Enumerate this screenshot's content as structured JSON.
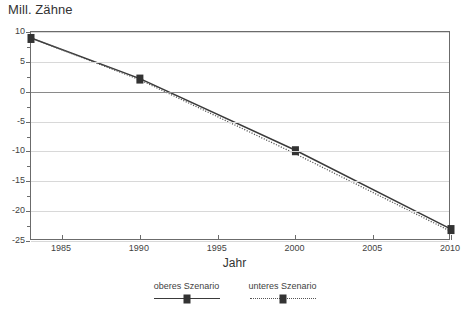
{
  "chart_data": {
    "type": "line",
    "title": "",
    "ylabel": "Mill. Zähne",
    "xlabel": "Jahr",
    "xlim": [
      1983,
      2010
    ],
    "ylim": [
      -25,
      10
    ],
    "grid": true,
    "legend_position": "bottom",
    "y_ticks": [
      10,
      5,
      0,
      -5,
      -10,
      -15,
      -20,
      -25
    ],
    "y_tick_labels": [
      "10",
      "5",
      "0",
      "-5",
      "-10",
      "-15",
      "-20",
      "-25"
    ],
    "y_minor_ticks": [
      7.5,
      2.5,
      -2.5,
      -7.5,
      -12.5,
      -17.5,
      -22.5
    ],
    "x_ticks": [
      1985,
      1990,
      1995,
      2000,
      2005,
      2010
    ],
    "x_tick_labels": [
      "1985",
      "1990",
      "1995",
      "2000",
      "2005",
      "2010"
    ],
    "x": [
      1983,
      1990,
      2000,
      2010
    ],
    "series": [
      {
        "name": "oberes Szenario",
        "style": "solid",
        "marker": "square",
        "color": "#3a3a3a",
        "values": [
          9.0,
          2.2,
          -9.8,
          -23.0
        ]
      },
      {
        "name": "unteres Szenario",
        "style": "dotted",
        "marker": "square",
        "color": "#555555",
        "values": [
          9.0,
          2.0,
          -10.4,
          -23.4
        ]
      }
    ]
  },
  "legend": {
    "items": [
      {
        "label": "oberes Szenario",
        "style": "solid"
      },
      {
        "label": "unteres Szenario",
        "style": "dotted"
      }
    ]
  },
  "colors": {
    "axis": "#6b6b6b",
    "grid": "#d8d8d8",
    "zero_line": "#8a8a8a",
    "text": "#3f3f3f",
    "series_upper": "#3a3a3a",
    "series_lower": "#555555"
  }
}
